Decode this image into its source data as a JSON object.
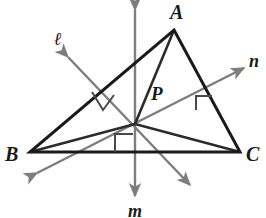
{
  "figure": {
    "type": "geometry-diagram",
    "width": 266,
    "height": 218,
    "background_color": "#ffffff",
    "colors": {
      "triangle_stroke": "#1a1a1a",
      "cevian_stroke": "#2b2b2b",
      "bisector_line": "#7d7d7d",
      "right_angle_mark": "#4a4a4a",
      "label_text": "#1a1a1a"
    },
    "vertices": [
      {
        "name": "A",
        "label": "A",
        "x": 174,
        "y": 30
      },
      {
        "name": "B",
        "label": "B",
        "x": 30,
        "y": 152
      },
      {
        "name": "C",
        "label": "C",
        "x": 240,
        "y": 152
      }
    ],
    "center_point": {
      "name": "P",
      "label": "P",
      "x": 135,
      "y": 124
    },
    "lines": [
      {
        "name": "l",
        "label": "ℓ",
        "role": "perpendicular-bisector-of-AB",
        "x1": 68,
        "y1": 57,
        "x2": 190,
        "y2": 185,
        "arrow_both_ends": true
      },
      {
        "name": "m",
        "label": "m",
        "role": "perpendicular-bisector-of-BC",
        "x1": 135,
        "y1": 10,
        "x2": 135,
        "y2": 196,
        "arrow_both_ends": true
      },
      {
        "name": "n",
        "label": "n",
        "role": "perpendicular-bisector-of-AC",
        "x1": 37,
        "y1": 173,
        "x2": 244,
        "y2": 68,
        "arrow_both_ends": true
      }
    ],
    "segments_from_center": [
      {
        "from": "P",
        "to": "A"
      },
      {
        "from": "P",
        "to": "B"
      },
      {
        "from": "P",
        "to": "C"
      }
    ],
    "right_angle_marks": [
      {
        "on_side": "AB",
        "x": 100,
        "y": 100
      },
      {
        "on_side": "AC",
        "x": 205,
        "y": 102
      },
      {
        "on_side": "BC",
        "x": 124,
        "y": 143
      }
    ],
    "labels": {
      "A": "A",
      "B": "B",
      "C": "C",
      "P": "P",
      "l": "ℓ",
      "m": "m",
      "n": "n"
    }
  }
}
